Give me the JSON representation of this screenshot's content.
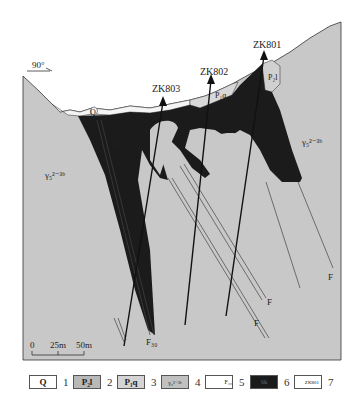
{
  "figure": {
    "orientation_label": "90°",
    "drill_holes": [
      {
        "id": "ZK803"
      },
      {
        "id": "ZK802"
      },
      {
        "id": "ZK801"
      }
    ],
    "unit_labels": {
      "quaternary": "Q",
      "p2l": "P₂l",
      "p1q": "P₁q",
      "granite_left": "γ₅²⁻³ᵇ",
      "granite_right": "γ₅²⁻³ᵇ",
      "orebody": "Sk"
    },
    "fault_labels": {
      "f30": "F₃₀",
      "f_a": "F",
      "f_b": "F",
      "f_c": "F"
    },
    "scale_bar": {
      "ticks": [
        "0",
        "25m",
        "50m"
      ]
    },
    "colors": {
      "granite": "#c8c8c8",
      "orebody": "#1a1a1a",
      "quaternary": "#f2f2f2",
      "strata": "#d6d6d6",
      "line": "#222222"
    }
  },
  "legend": {
    "items": [
      {
        "symbol": "Q",
        "num": "1"
      },
      {
        "symbol": "P₂l",
        "num": "2"
      },
      {
        "symbol": "P₁q",
        "num": "3"
      },
      {
        "symbol": "γ₅²⁻³ᵇ",
        "num": "4"
      },
      {
        "symbol": "F₃₀",
        "num": "5"
      },
      {
        "symbol": "Sk",
        "num": "6"
      },
      {
        "symbol": "ZK801",
        "num": "7"
      }
    ]
  }
}
